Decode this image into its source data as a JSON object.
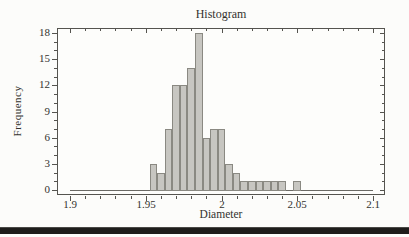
{
  "chart_data": {
    "type": "bar",
    "subtype": "histogram",
    "title": "Histogram",
    "xlabel": "Diameter",
    "ylabel": "Frequency",
    "bin_width": 0.005,
    "bin_midpoints": [
      1.955,
      1.96,
      1.965,
      1.97,
      1.975,
      1.98,
      1.985,
      1.99,
      1.995,
      2.0,
      2.005,
      2.01,
      2.015,
      2.02,
      2.025,
      2.03,
      2.035,
      2.04,
      2.045,
      2.05
    ],
    "counts": [
      3,
      2,
      7,
      12,
      12,
      14,
      18,
      6,
      7,
      7,
      3,
      2,
      1,
      1,
      1,
      1,
      1,
      1,
      0,
      1
    ],
    "total_count": 100,
    "x_ticks": {
      "major": [
        1.9,
        1.95,
        2.0,
        2.05,
        2.1
      ],
      "labels": [
        "1.9",
        "1.95",
        "2",
        "2.05",
        "2.1"
      ],
      "minor_step": 0.01
    },
    "y_ticks": {
      "major": [
        0,
        3,
        6,
        9,
        12,
        15,
        18
      ],
      "labels": [
        "0",
        "3",
        "6",
        "9",
        "12",
        "15",
        "18"
      ],
      "minor_step": 1
    },
    "xlim": [
      1.8914,
      2.1079
    ],
    "ylim": [
      -0.573,
      18.573
    ],
    "grid": false,
    "legend": "none",
    "colors": {
      "bar_fill": "#c7c6c1",
      "bar_stroke": "#8a8982",
      "frame": "#55544f",
      "baseline": "#6b6a65",
      "text": "#33322e",
      "page_background": "#fcfcfa",
      "divider_rule": "#1e1d1b"
    }
  }
}
